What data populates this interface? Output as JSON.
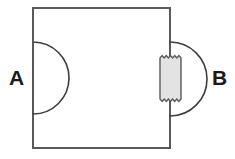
{
  "figure": {
    "type": "line-diagram",
    "title": "",
    "background_color": "#ffffff",
    "stroke_color": "#595959",
    "label_color": "#1a1a1a",
    "shaded_fill_color": "#e3e3e3",
    "labels": {
      "left": "A",
      "right": "B"
    },
    "elements": {
      "main_box": {
        "name": "rectangle",
        "x": 33,
        "y": 8,
        "width": 137,
        "height": 140,
        "fill": "none",
        "stroke": "#595959",
        "stroke_width": 2
      },
      "left_semicircle": {
        "name": "semicircle-left",
        "center_x": 33,
        "center_y": 78,
        "radius": 36,
        "bulge_direction": "right",
        "stroke": "#3d3d3d",
        "stroke_width": 1.6
      },
      "left_dashed_diameter": {
        "name": "dashed-line",
        "x": 33,
        "y1": 42,
        "y2": 114,
        "dash_pattern": "6 5",
        "stroke": "#595959",
        "stroke_width": 1.8
      },
      "right_semicircle": {
        "name": "semicircle-right",
        "center_x": 170,
        "center_y": 79,
        "radius": 37,
        "bulge_direction": "right",
        "stroke": "#3d3d3d",
        "stroke_width": 1.6
      },
      "right_torn_rectangle": {
        "name": "shaded-torn-rectangle",
        "x": 160,
        "y": 56,
        "width": 21,
        "height": 45,
        "fill": "#e3e3e3",
        "stroke": "#595959",
        "stroke_width": 1.4,
        "edge_style": "zigzag-top-and-bottom",
        "zigzag_teeth": 5
      }
    }
  }
}
